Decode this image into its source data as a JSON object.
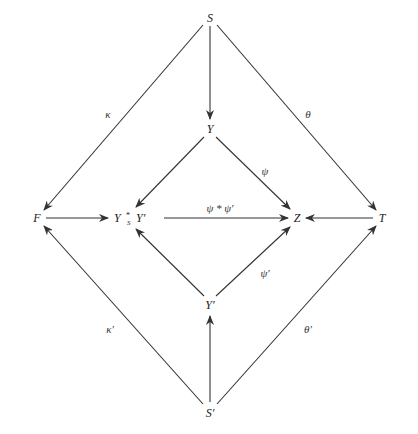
{
  "diagram": {
    "type": "commutative-diagram",
    "nodes": {
      "S": "S",
      "Y": "Y",
      "F": "F",
      "fiber_left": "Y",
      "fiber_op": "*",
      "fiber_sub": "S",
      "fiber_right": "Y′",
      "Z": "Z",
      "T": "T",
      "Yp": "Y′",
      "Sp": "S′"
    },
    "labels": {
      "kappa": "κ",
      "theta": "θ",
      "psi": "ψ",
      "psi_star": "ψ * ψ′",
      "psi_prime": "ψ′",
      "kappa_prime": "κ′",
      "theta_prime": "θ′"
    },
    "edges": [
      {
        "from": "S",
        "to": "Y",
        "label": ""
      },
      {
        "from": "S",
        "to": "F",
        "label": "κ"
      },
      {
        "from": "S",
        "to": "T",
        "label": "θ"
      },
      {
        "from": "Y",
        "to": "Y ×_S Y′",
        "label": ""
      },
      {
        "from": "Y",
        "to": "Z",
        "label": "ψ"
      },
      {
        "from": "F",
        "to": "Y ×_S Y′",
        "label": ""
      },
      {
        "from": "Y ×_S Y′",
        "to": "Z",
        "label": "ψ * ψ′"
      },
      {
        "from": "T",
        "to": "Z",
        "label": ""
      },
      {
        "from": "Y′",
        "to": "Y ×_S Y′",
        "label": ""
      },
      {
        "from": "Y′",
        "to": "Z",
        "label": "ψ′"
      },
      {
        "from": "S′",
        "to": "Y′",
        "label": ""
      },
      {
        "from": "S′",
        "to": "F",
        "label": "κ′"
      },
      {
        "from": "S′",
        "to": "T",
        "label": "θ′"
      }
    ]
  }
}
